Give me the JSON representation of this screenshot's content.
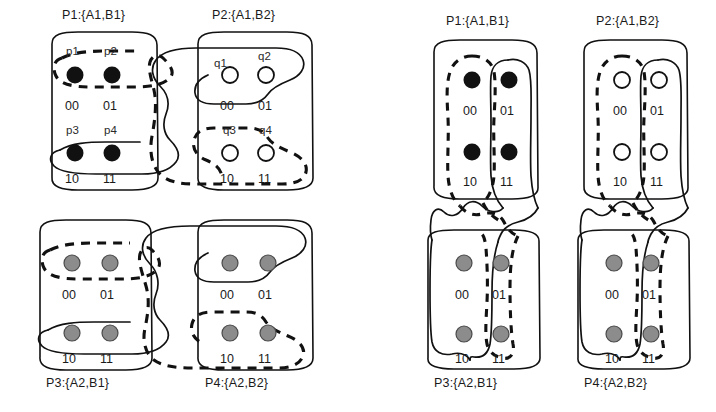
{
  "figure": {
    "title": "",
    "panels": [
      {
        "id": "left",
        "name": "row-grouping-configuration",
        "boxes": [
          {
            "id": "P1",
            "caption": "P1:{A1,B1}",
            "caption_position": "top",
            "node_style": "filled-black",
            "cells": [
              "00",
              "01",
              "10",
              "11"
            ],
            "node_tags": [
              "p1",
              "p2",
              "p3",
              "p4"
            ],
            "groups": [
              {
                "style": "dashed",
                "cells": [
                  "00",
                  "01"
                ]
              },
              {
                "style": "solid",
                "cells": [
                  "10",
                  "11"
                ]
              }
            ]
          },
          {
            "id": "P2",
            "caption": "P2:{A1,B2}",
            "caption_position": "top",
            "node_style": "hollow-white",
            "cells": [
              "00",
              "01",
              "10",
              "11"
            ],
            "node_tags": [
              "q1",
              "q2",
              "q3",
              "q4"
            ],
            "groups": [
              {
                "style": "solid",
                "cells": [
                  "00",
                  "01"
                ]
              },
              {
                "style": "dashed",
                "cells": [
                  "10",
                  "11"
                ]
              }
            ]
          },
          {
            "id": "P3",
            "caption": "P3:{A2,B1}",
            "caption_position": "bottom",
            "node_style": "filled-gray",
            "cells": [
              "00",
              "01",
              "10",
              "11"
            ],
            "node_tags": [],
            "groups": [
              {
                "style": "dashed",
                "cells": [
                  "00",
                  "01"
                ]
              },
              {
                "style": "solid",
                "cells": [
                  "10",
                  "11"
                ]
              }
            ]
          },
          {
            "id": "P4",
            "caption": "P4:{A2,B2}",
            "caption_position": "bottom",
            "node_style": "filled-gray",
            "cells": [
              "00",
              "01",
              "10",
              "11"
            ],
            "node_tags": [],
            "groups": [
              {
                "style": "solid",
                "cells": [
                  "00",
                  "01"
                ]
              },
              {
                "style": "dashed",
                "cells": [
                  "10",
                  "11"
                ]
              }
            ]
          }
        ]
      },
      {
        "id": "right",
        "name": "column-grouping-configuration",
        "boxes": [
          {
            "id": "P1",
            "caption": "P1:{A1,B1}",
            "caption_position": "top",
            "node_style": "filled-black",
            "cells": [
              "00",
              "01",
              "10",
              "11"
            ],
            "node_tags": [],
            "groups": [
              {
                "style": "dashed",
                "cells": [
                  "00",
                  "10"
                ]
              },
              {
                "style": "solid",
                "cells": [
                  "01",
                  "11"
                ]
              }
            ]
          },
          {
            "id": "P2",
            "caption": "P2:{A1,B2}",
            "caption_position": "top",
            "node_style": "hollow-white",
            "cells": [
              "00",
              "01",
              "10",
              "11"
            ],
            "node_tags": [],
            "groups": [
              {
                "style": "dashed",
                "cells": [
                  "00",
                  "10"
                ]
              },
              {
                "style": "solid",
                "cells": [
                  "01",
                  "11"
                ]
              }
            ]
          },
          {
            "id": "P3",
            "caption": "P3:{A2,B1}",
            "caption_position": "bottom",
            "node_style": "filled-gray",
            "cells": [
              "00",
              "01",
              "10",
              "11"
            ],
            "node_tags": [],
            "groups": [
              {
                "style": "solid",
                "cells": [
                  "00",
                  "10"
                ]
              },
              {
                "style": "dashed",
                "cells": [
                  "01",
                  "11"
                ]
              }
            ]
          },
          {
            "id": "P4",
            "caption": "P4:{A2,B2}",
            "caption_position": "bottom",
            "node_style": "filled-gray",
            "cells": [
              "00",
              "01",
              "10",
              "11"
            ],
            "node_tags": [],
            "groups": [
              {
                "style": "solid",
                "cells": [
                  "00",
                  "10"
                ]
              },
              {
                "style": "dashed",
                "cells": [
                  "01",
                  "11"
                ]
              }
            ]
          }
        ]
      }
    ],
    "colors": {
      "stroke": "#111111",
      "node_black": "#111111",
      "node_gray": "#8c8c8c",
      "node_white": "#ffffff",
      "background": "#ffffff"
    },
    "labels": {
      "left_P1_caption": "P1:{A1,B1}",
      "left_P2_caption": "P2:{A1,B2}",
      "left_P3_caption": "P3:{A2,B1}",
      "left_P4_caption": "P4:{A2,B2}",
      "right_P1_caption": "P1:{A1,B1}",
      "right_P2_caption": "P2:{A1,B2}",
      "right_P3_caption": "P3:{A2,B1}",
      "right_P4_caption": "P4:{A2,B2}",
      "cell_00": "00",
      "cell_01": "01",
      "cell_10": "10",
      "cell_11": "11",
      "tag_p1": "p1",
      "tag_p2": "p2",
      "tag_p3": "p3",
      "tag_p4": "p4",
      "tag_q1": "q1",
      "tag_q2": "q2",
      "tag_q3": "q3",
      "tag_q4": "q4"
    }
  }
}
